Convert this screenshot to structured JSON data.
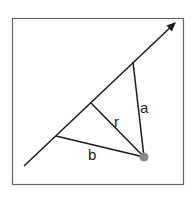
{
  "diagram": {
    "labels": {
      "a": "a",
      "r": "r",
      "b": "b"
    },
    "colors": {
      "frame": "#555555",
      "line": "#1a1a1a",
      "point": "#888888"
    },
    "elements": {
      "frame": {
        "x": 12,
        "y": 18,
        "w": 171,
        "h": 166
      },
      "main_line": {
        "x1": 24,
        "y1": 166,
        "x2": 175,
        "y2": 23,
        "arrow_end": true
      },
      "point": {
        "cx": 144,
        "cy": 157,
        "r": 4
      },
      "segments": [
        {
          "name": "a",
          "from": [
            144,
            157
          ],
          "to": [
            133,
            62
          ]
        },
        {
          "name": "r",
          "from": [
            144,
            157
          ],
          "to": [
            91,
            103
          ]
        },
        {
          "name": "b",
          "from": [
            144,
            157
          ],
          "to": [
            56,
            136
          ]
        }
      ]
    }
  }
}
